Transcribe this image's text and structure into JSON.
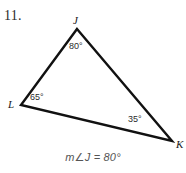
{
  "problem": {
    "number": "11.",
    "answer_text": "m∠J = 80°"
  },
  "colors": {
    "background": "#ffffff",
    "stroke": "#111111",
    "label_text": "#1a1a1a",
    "answer_text": "#555555"
  },
  "figure": {
    "type": "triangle",
    "vertices": [
      {
        "name": "J",
        "label": "J",
        "x": 77,
        "y": 29
      },
      {
        "name": "K",
        "label": "K",
        "x": 172,
        "y": 141
      },
      {
        "name": "L",
        "label": "L",
        "x": 21,
        "y": 105
      }
    ],
    "angles": [
      {
        "at": "J",
        "label": "80°",
        "value": 80
      },
      {
        "at": "L",
        "label": "65°",
        "value": 65
      },
      {
        "at": "K",
        "label": "35°",
        "value": 35
      }
    ],
    "sides": [
      {
        "from": "J",
        "to": "L"
      },
      {
        "from": "J",
        "to": "K"
      },
      {
        "from": "L",
        "to": "K"
      }
    ]
  }
}
